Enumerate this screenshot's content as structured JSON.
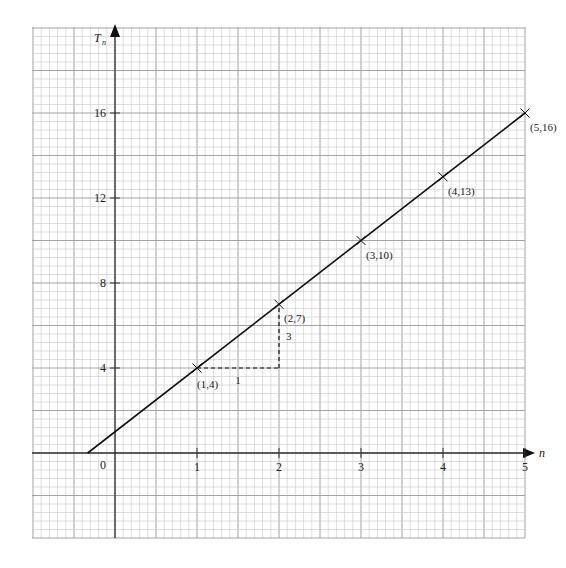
{
  "chart_data": {
    "type": "line",
    "title": "",
    "xlabel": "n",
    "ylabel": "T",
    "ylabel_subscript": "n",
    "origin_label": "0",
    "x_ticks": [
      1,
      2,
      3,
      4,
      5
    ],
    "y_ticks": [
      4,
      8,
      12,
      16
    ],
    "xlim": [
      -1.0,
      5.0
    ],
    "ylim": [
      -4.0,
      20.0
    ],
    "grid": true,
    "legend": "none",
    "series": [
      {
        "name": "T_n = 3n + 1",
        "line_from": [
          -0.333,
          0
        ],
        "line_to": [
          5,
          16
        ],
        "points": [
          {
            "x": 1,
            "y": 4,
            "label": "(1,4)"
          },
          {
            "x": 2,
            "y": 7,
            "label": "(2,7)"
          },
          {
            "x": 3,
            "y": 10,
            "label": "(3,10)"
          },
          {
            "x": 4,
            "y": 13,
            "label": "(4,13)"
          },
          {
            "x": 5,
            "y": 16,
            "label": "(5,16)"
          }
        ]
      }
    ],
    "annotations": [
      {
        "type": "dashed-horizontal",
        "from": [
          1,
          4
        ],
        "to": [
          2,
          4
        ],
        "label": "1"
      },
      {
        "type": "dashed-vertical",
        "from": [
          2,
          4
        ],
        "to": [
          2,
          7
        ],
        "label": "3"
      }
    ]
  },
  "colors": {
    "minor_grid": "#c8c8c8",
    "major_grid": "#9a9a9a",
    "axis": "#333333",
    "line": "#111111"
  }
}
